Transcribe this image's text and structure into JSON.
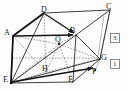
{
  "figure": {
    "type": "geometry-diagram",
    "stroke_color": "#1c1c1c",
    "dash_color": "#5a5a5a",
    "background": "#fdfdfd"
  },
  "vertices": [
    {
      "id": "D",
      "label": "D",
      "x": 41,
      "y": 6,
      "interactable": false
    },
    {
      "id": "C",
      "label": "C",
      "x": 106,
      "y": 3,
      "interactable": false
    },
    {
      "id": "A",
      "label": "A",
      "x": 4,
      "y": 29,
      "interactable": false
    },
    {
      "id": "B",
      "label": "B",
      "x": 70,
      "y": 27,
      "interactable": false
    },
    {
      "id": "Q",
      "label": "Q",
      "x": 55,
      "y": 36,
      "interactable": false
    },
    {
      "id": "G",
      "label": "G",
      "x": 101,
      "y": 54,
      "interactable": false
    },
    {
      "id": "H",
      "label": "H",
      "x": 42,
      "y": 65,
      "interactable": false
    },
    {
      "id": "P",
      "label": "P",
      "x": 92,
      "y": 68,
      "interactable": false
    },
    {
      "id": "E",
      "label": "E",
      "x": 3,
      "y": 76,
      "interactable": false
    },
    {
      "id": "F",
      "label": "F",
      "x": 68,
      "y": 76,
      "interactable": false
    }
  ],
  "measure_boxes": [
    {
      "id": "box-3",
      "label": "3",
      "x": 110,
      "y": 33
    },
    {
      "id": "box-1",
      "label": "1",
      "x": 110,
      "y": 59
    }
  ],
  "points": {
    "D": [
      44,
      13
    ],
    "C": [
      110,
      10
    ],
    "A": [
      13,
      36
    ],
    "B": [
      76,
      35
    ],
    "E": [
      11,
      83
    ],
    "F": [
      73,
      82
    ],
    "G": [
      100,
      59
    ],
    "H": [
      46,
      72
    ],
    "Q": [
      59,
      44
    ],
    "P": [
      95,
      70
    ],
    "M": [
      88,
      55
    ]
  },
  "edges_solid": [
    [
      "D",
      "C"
    ],
    [
      "D",
      "A"
    ],
    [
      "D",
      "B"
    ],
    [
      "C",
      "B"
    ],
    [
      "C",
      "G"
    ],
    [
      "A",
      "B"
    ],
    [
      "A",
      "E"
    ],
    [
      "B",
      "F"
    ],
    [
      "B",
      "G"
    ],
    [
      "E",
      "F"
    ],
    [
      "F",
      "G"
    ],
    [
      "E",
      "D"
    ],
    [
      "E",
      "B"
    ],
    [
      "E",
      "G"
    ],
    [
      "E",
      "P"
    ]
  ],
  "edges_dashed": [
    [
      "A",
      "H"
    ],
    [
      "H",
      "G"
    ],
    [
      "H",
      "D"
    ],
    [
      "E",
      "H"
    ],
    [
      "A",
      "Q"
    ],
    [
      "Q",
      "B"
    ],
    [
      "Q",
      "E"
    ],
    [
      "Q",
      "G"
    ],
    [
      "Q",
      "H"
    ],
    [
      "Q",
      "F"
    ]
  ],
  "arrow_segments": [
    {
      "from": "A",
      "to": "B",
      "name": "arrow-a-to-b"
    },
    {
      "from": "D",
      "to": "B",
      "name": "arrow-d-to-b"
    },
    {
      "from": "E",
      "to": "P",
      "name": "arrow-e-to-p"
    }
  ]
}
